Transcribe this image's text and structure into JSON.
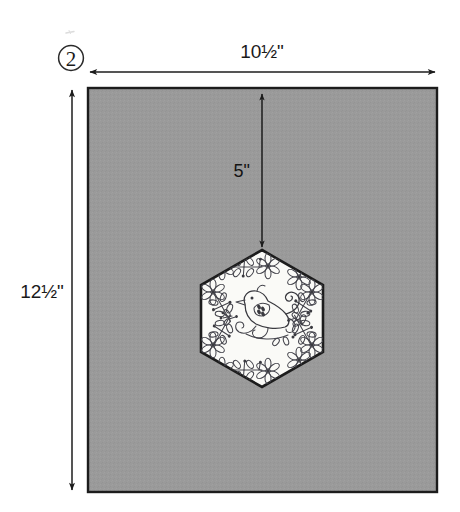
{
  "figure": {
    "step_label": "2",
    "background_color": "#ffffff"
  },
  "dimensions": {
    "width_label": "10½\"",
    "height_label": "12½\"",
    "inset_top_label": "5\""
  },
  "background_piece": {
    "name": "background rectangle",
    "fill_color": "#9a9a9a",
    "border_color": "#1c1c1c"
  },
  "applique_patch": {
    "name": "embroidered hexagon patch",
    "shape": "hexagon",
    "fill_color": "#fafaf7",
    "border_color": "#1c1c1c",
    "motif": "bird with floral vine border"
  },
  "arrows": {
    "width_arrow": "double-headed horizontal arrow",
    "height_arrow": "double-headed vertical arrow",
    "inset_arrow": "double-headed vertical arrow"
  }
}
